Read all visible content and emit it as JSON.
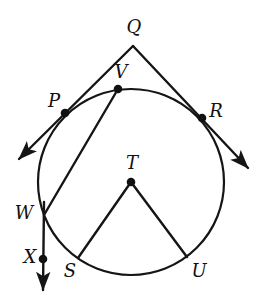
{
  "figure": {
    "stroke_color": "#151515",
    "background_color": "#ffffff",
    "dot_color": "#111111",
    "stroke_width": 2.2,
    "label_font_size": 18
  },
  "circle": {
    "center_label": "T",
    "center": {
      "x": 131,
      "y": 182
    },
    "radius": 93
  },
  "points": [
    {
      "name": "Q",
      "label": "Q",
      "x": 133,
      "y": 46,
      "label_x": 134,
      "label_y": 27,
      "has_dot": false,
      "role": "external-tangent-vertex"
    },
    {
      "name": "V",
      "label": "V",
      "x": 118,
      "y": 89,
      "label_x": 121,
      "label_y": 72,
      "has_dot": true,
      "role": "point-on-circle"
    },
    {
      "name": "P",
      "label": "P",
      "x": 65,
      "y": 113,
      "label_x": 54,
      "label_y": 101,
      "has_dot": true,
      "role": "tangent-point"
    },
    {
      "name": "R",
      "label": "R",
      "x": 202,
      "y": 118,
      "label_x": 216,
      "label_y": 111,
      "has_dot": true,
      "role": "tangent-point"
    },
    {
      "name": "T",
      "label": "T",
      "x": 131,
      "y": 182,
      "label_x": 132,
      "label_y": 163,
      "has_dot": true,
      "role": "center"
    },
    {
      "name": "W",
      "label": "W",
      "x": 44,
      "y": 215,
      "label_x": 24,
      "label_y": 213,
      "has_dot": false,
      "role": "point-on-circle"
    },
    {
      "name": "X",
      "label": "X",
      "x": 43,
      "y": 259,
      "label_x": 30,
      "label_y": 257,
      "has_dot": true,
      "role": "point-on-ray"
    },
    {
      "name": "S",
      "label": "S",
      "x": 78,
      "y": 258,
      "label_x": 70,
      "label_y": 271,
      "has_dot": false,
      "role": "point-on-circle"
    },
    {
      "name": "U",
      "label": "U",
      "x": 187,
      "y": 257,
      "label_x": 199,
      "label_y": 271,
      "has_dot": false,
      "role": "point-on-circle"
    }
  ],
  "segments": [
    {
      "name": "QP-tangent-left",
      "from": "Q",
      "to": "P",
      "kind": "tangent"
    },
    {
      "name": "QR-tangent-right",
      "from": "Q",
      "to": "R",
      "kind": "tangent"
    },
    {
      "name": "VW-chord",
      "from": "V",
      "to": "W",
      "kind": "chord"
    },
    {
      "name": "TS-radius",
      "from": "T",
      "to": "S",
      "kind": "radius"
    },
    {
      "name": "TU-radius",
      "from": "T",
      "to": "U",
      "kind": "radius"
    }
  ],
  "rays": [
    {
      "name": "ray-through-P",
      "from": "Q",
      "through": "P",
      "tip_x": 17,
      "tip_y": 161,
      "arrow": true
    },
    {
      "name": "ray-through-R",
      "from": "Q",
      "through": "R",
      "tip_x": 250,
      "tip_y": 170,
      "arrow": true
    },
    {
      "name": "ray-WX-down",
      "from": "W",
      "through": "X",
      "tip_x": 43,
      "tip_y": 292,
      "arrow": true
    }
  ]
}
